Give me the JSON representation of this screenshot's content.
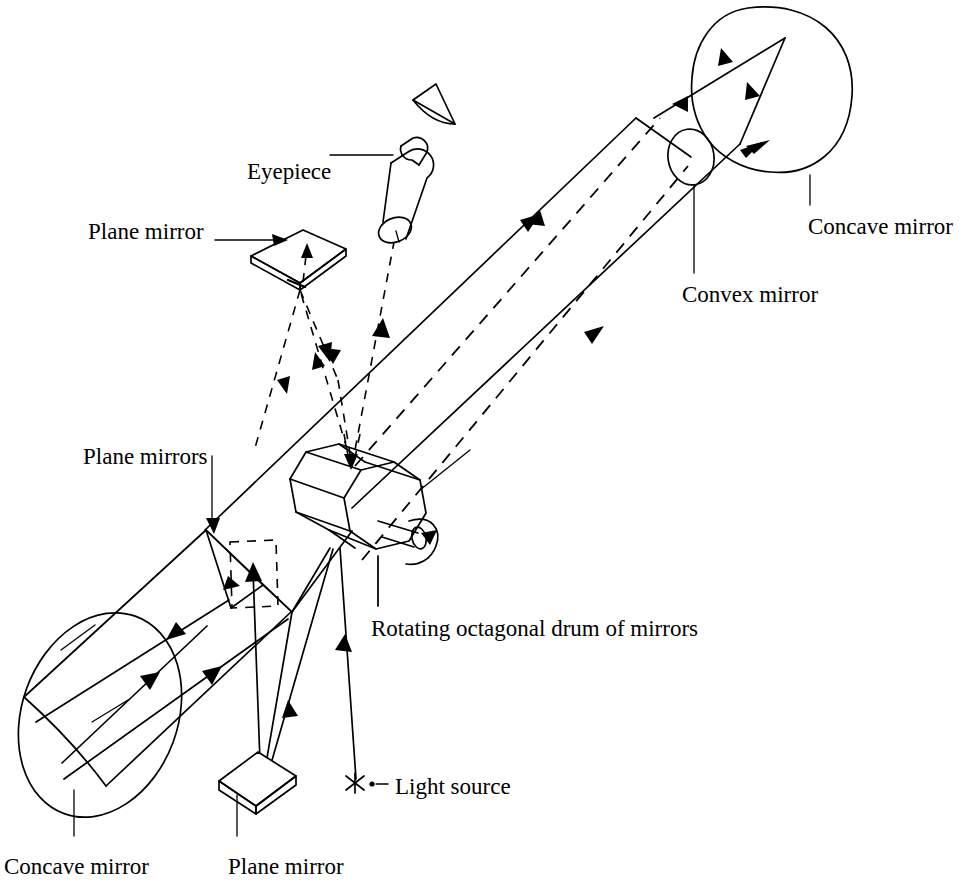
{
  "figure": {
    "background_color": "#ffffff",
    "line_color": "#000000",
    "width": 961,
    "height": 896
  },
  "labels": [
    {
      "id": "eyepiece",
      "text": "Eyepiece",
      "x": 247,
      "y": 160,
      "anchor": "start"
    },
    {
      "id": "plane-mirror-top",
      "text": "Plane mirror",
      "x": 88,
      "y": 220,
      "anchor": "start"
    },
    {
      "id": "concave-mirror-tr",
      "text": "Concave mirror",
      "x": 808,
      "y": 215,
      "anchor": "start"
    },
    {
      "id": "convex-mirror",
      "text": "Convex mirror",
      "x": 682,
      "y": 283,
      "anchor": "start"
    },
    {
      "id": "plane-mirrors",
      "text": "Plane mirrors",
      "x": 83,
      "y": 445,
      "anchor": "start"
    },
    {
      "id": "rotating-drum",
      "text": "Rotating octagonal drum of mirrors",
      "x": 371,
      "y": 617,
      "anchor": "start"
    },
    {
      "id": "light-source",
      "text": "Light source",
      "x": 395,
      "y": 775,
      "anchor": "start"
    },
    {
      "id": "concave-mirror-bl",
      "text": "Concave mirror",
      "x": 4,
      "y": 855,
      "anchor": "start"
    },
    {
      "id": "plane-mirror-bot",
      "text": "Plane mirror",
      "x": 228,
      "y": 855,
      "anchor": "start"
    }
  ],
  "components": [
    {
      "id": "eye",
      "name": "observer-eye",
      "kind": "eye-wedge"
    },
    {
      "id": "eyepiece-barrel",
      "name": "eyepiece",
      "kind": "cylinder"
    },
    {
      "id": "plane-mirror-upper",
      "name": "plane-mirror-upper",
      "kind": "flat-mirror-slab"
    },
    {
      "id": "octagon-drum",
      "name": "rotating-octagonal-drum",
      "kind": "octagonal-prism-with-shaft"
    },
    {
      "id": "rotation-arrow",
      "name": "rotation-direction-arrow",
      "kind": "curved-arrow"
    },
    {
      "id": "concave-mirror-large",
      "name": "concave-mirror-large",
      "kind": "ellipse-dish"
    },
    {
      "id": "plane-mirror-lower",
      "name": "plane-mirror-lower",
      "kind": "flat-mirror-slab"
    },
    {
      "id": "plane-mirrors-pair",
      "name": "plane-mirrors-pair",
      "kind": "dashed-parallelogram-pair"
    },
    {
      "id": "concave-mirror-small",
      "name": "concave-mirror-distant",
      "kind": "closed-blob"
    },
    {
      "id": "convex-mirror-small",
      "name": "convex-mirror-distant",
      "kind": "small-ellipse"
    },
    {
      "id": "light-source-star",
      "name": "light-source-star",
      "kind": "asterisk"
    }
  ],
  "rays": {
    "solid_description": "Outgoing light beam from the light source, off the rotating drum and mirrors, out to the distant concave and convex mirrors.",
    "dashed_description": "Returning light beam back through the drum and plane mirror into the eyepiece."
  }
}
